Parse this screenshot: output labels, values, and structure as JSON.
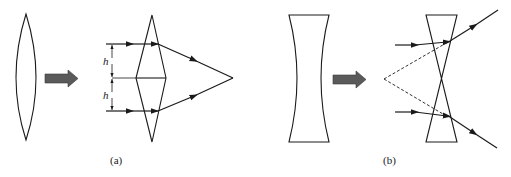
{
  "figure": {
    "panels": [
      {
        "id": "a",
        "caption": "(a)",
        "description": "Converging (convex) lens approximated by two prisms placed base-to-base",
        "dimension_labels": [
          "h",
          "h"
        ]
      },
      {
        "id": "b",
        "caption": "(b)",
        "description": "Diverging (concave) lens approximated by two prisms placed apex-to-apex"
      }
    ],
    "colors": {
      "line": "#1a1a1a",
      "arrow_fill": "#5a5a5a",
      "background": "#ffffff"
    }
  }
}
